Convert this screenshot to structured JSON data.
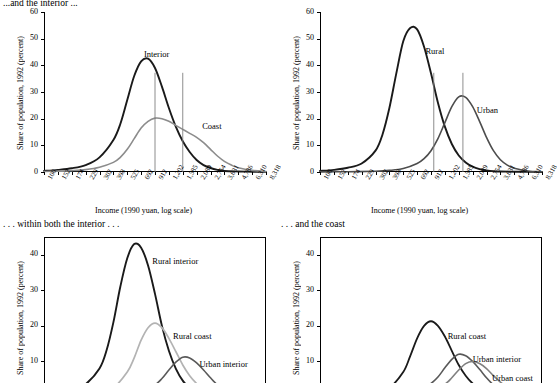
{
  "captions": {
    "top_left_partial": "...and the interior ...",
    "bottom_left": ". . . within both the interior . . .",
    "bottom_right": ". . . and the coast"
  },
  "axis": {
    "ylabel": "Share of population, 1992 (percent)",
    "xlabel": "Income (1990 yuan, log scale)",
    "yticks": [
      "0",
      "10",
      "20",
      "30",
      "40",
      "50",
      "60"
    ],
    "yticks_bottom": [
      "0",
      "10",
      "20",
      "30",
      "40"
    ],
    "xticks": [
      "100",
      "152",
      "174",
      "229",
      "302",
      "398",
      "525",
      "692",
      "912",
      "1,202",
      "1,585",
      "2,089",
      "2,754",
      "3,631",
      "4,786",
      "6,310",
      "8,318"
    ]
  },
  "chart_data": [
    {
      "id": "top-left",
      "type": "line",
      "title": "",
      "xlabel": "Income (1990 yuan, log scale)",
      "ylabel": "Share of population, 1992 (percent)",
      "xlim": [
        100,
        8318
      ],
      "ylim": [
        0,
        60
      ],
      "grid": false,
      "legend": "inline-annotations",
      "xtick_labels": [
        "100",
        "152",
        "174",
        "229",
        "302",
        "398",
        "525",
        "692",
        "912",
        "1,202",
        "1,585",
        "2,089",
        "2,754",
        "3,631",
        "4,786",
        "6,310",
        "8,318"
      ],
      "ytick_labels": [
        "0",
        "10",
        "20",
        "30",
        "40",
        "50",
        "60"
      ],
      "annotations": [
        {
          "text": "Interior",
          "x_index": 7.2,
          "y": 44
        },
        {
          "text": "Coast",
          "x_index": 11.4,
          "y": 17
        }
      ],
      "vertical_reference_lines": [
        {
          "x_index": 8.0
        },
        {
          "x_index": 10.0
        }
      ],
      "series": [
        {
          "name": "Interior",
          "color": "#1a1a1a",
          "width": 1.9,
          "x_index": [
            0,
            1,
            2,
            3,
            4,
            5,
            5.5,
            6,
            6.5,
            7,
            7.5,
            8,
            8.5,
            9,
            9.5,
            10,
            10.5,
            11,
            11.5,
            12,
            12.5,
            13,
            14,
            15,
            16
          ],
          "values": [
            0.4,
            0.8,
            1.4,
            2.6,
            5.5,
            12,
            18,
            27,
            36,
            41.5,
            42.5,
            39,
            32,
            24,
            17,
            11.5,
            7.5,
            4.5,
            2.6,
            1.5,
            0.8,
            0.4,
            0.2,
            0.1,
            0.05
          ]
        },
        {
          "name": "Coast",
          "color": "#8c8c8c",
          "width": 1.6,
          "x_index": [
            0,
            1,
            2,
            3,
            4,
            5,
            5.5,
            6,
            6.5,
            7,
            7.5,
            8,
            8.5,
            9,
            9.5,
            10,
            10.5,
            11,
            11.5,
            12,
            12.5,
            13,
            13.5,
            14,
            15,
            16
          ],
          "values": [
            0.2,
            0.3,
            0.5,
            0.9,
            1.8,
            3.6,
            5.5,
            8.5,
            12.5,
            16.5,
            19,
            20.2,
            20,
            19,
            17.5,
            16,
            14.5,
            13,
            11,
            8.5,
            6,
            4,
            2.6,
            1.6,
            0.6,
            0.2
          ]
        }
      ]
    },
    {
      "id": "top-right",
      "type": "line",
      "title": "",
      "xlabel": "Income (1990 yuan, log scale)",
      "ylabel": "Share of population, 1992 (percent)",
      "xlim": [
        100,
        8318
      ],
      "ylim": [
        0,
        60
      ],
      "grid": false,
      "xtick_labels": [
        "100",
        "152",
        "174",
        "229",
        "302",
        "398",
        "525",
        "692",
        "912",
        "1,202",
        "1,585",
        "2,089",
        "2,754",
        "3,631",
        "4,786",
        "6,310",
        "8,318"
      ],
      "ytick_labels": [
        "0",
        "10",
        "20",
        "30",
        "40",
        "50",
        "60"
      ],
      "annotations": [
        {
          "text": "Rural",
          "x_index": 7.6,
          "y": 45
        },
        {
          "text": "Urban",
          "x_index": 11.3,
          "y": 23
        }
      ],
      "vertical_reference_lines": [
        {
          "x_index": 8.2
        },
        {
          "x_index": 10.3
        }
      ],
      "series": [
        {
          "name": "Rural",
          "color": "#1a1a1a",
          "width": 1.9,
          "x_index": [
            0,
            1,
            2,
            3,
            4,
            4.5,
            5,
            5.5,
            6,
            6.5,
            7,
            7.5,
            8,
            8.5,
            9,
            9.5,
            10,
            10.5,
            11,
            11.5,
            12,
            12.5,
            13,
            14,
            15,
            16
          ],
          "values": [
            0.4,
            0.8,
            1.6,
            3.2,
            8,
            14,
            24,
            37,
            49,
            54,
            53.5,
            47,
            37,
            26,
            17,
            10.5,
            6.2,
            3.6,
            2,
            1.1,
            0.6,
            0.3,
            0.2,
            0.1,
            0.05,
            0.02
          ]
        },
        {
          "name": "Urban",
          "color": "#4d4d4d",
          "width": 1.6,
          "x_index": [
            0,
            2,
            4,
            5,
            6,
            7,
            7.5,
            8,
            8.5,
            9,
            9.5,
            10,
            10.5,
            11,
            11.5,
            12,
            12.5,
            13,
            13.5,
            14,
            15,
            16
          ],
          "values": [
            0.05,
            0.1,
            0.3,
            0.6,
            1.3,
            3.2,
            5,
            8,
            12.5,
            18.5,
            24.5,
            28.2,
            28,
            24.5,
            19,
            13,
            8,
            4.6,
            2.6,
            1.4,
            0.4,
            0.1
          ]
        }
      ]
    },
    {
      "id": "bottom-left",
      "type": "line",
      "title": ". . . within both the interior . . .",
      "ylabel": "Share of population, 1992 (percent)",
      "xlim": [
        100,
        8318
      ],
      "ylim": [
        0,
        45
      ],
      "grid": false,
      "ytick_labels": [
        "0",
        "10",
        "20",
        "30",
        "40"
      ],
      "annotations": [
        {
          "text": "Rural interior",
          "x_index": 7.8,
          "y": 38
        },
        {
          "text": "Rural coast",
          "x_index": 9.3,
          "y": 17
        },
        {
          "text": "Urban interior",
          "x_index": 11.2,
          "y": 9
        }
      ],
      "series": [
        {
          "name": "Rural interior",
          "color": "#1a1a1a",
          "width": 1.9,
          "x_index": [
            0,
            1,
            2,
            3,
            4,
            4.5,
            5,
            5.5,
            6,
            6.5,
            7,
            7.5,
            8,
            8.5,
            9,
            9.5,
            10,
            10.5,
            11,
            11.5,
            12,
            12.5,
            13,
            14,
            15,
            16
          ],
          "values": [
            0.4,
            0.9,
            1.8,
            3.6,
            8,
            13,
            21,
            31,
            39,
            43,
            42,
            37,
            29,
            20,
            13,
            8,
            4.6,
            2.6,
            1.4,
            0.8,
            0.4,
            0.2,
            0.1,
            0.05,
            0.02,
            0.01
          ]
        },
        {
          "name": "Rural coast",
          "color": "#b3b3b3",
          "width": 1.7,
          "x_index": [
            0,
            2,
            4,
            5,
            6,
            6.5,
            7,
            7.5,
            8,
            8.5,
            9,
            9.5,
            10,
            10.5,
            11,
            11.5,
            12,
            12.5,
            13,
            14,
            15,
            16
          ],
          "values": [
            0.1,
            0.3,
            1.2,
            2.6,
            7,
            11,
            16,
            19.5,
            20.8,
            19.5,
            16.5,
            12.8,
            9,
            6,
            3.8,
            2.2,
            1.2,
            0.6,
            0.3,
            0.1,
            0.05,
            0.02
          ]
        },
        {
          "name": "Urban interior",
          "color": "#595959",
          "width": 1.6,
          "x_index": [
            0,
            4,
            6,
            7,
            8,
            8.5,
            9,
            9.5,
            10,
            10.5,
            11,
            11.5,
            12,
            12.5,
            13,
            13.5,
            14,
            15,
            16
          ],
          "values": [
            0.02,
            0.1,
            0.4,
            1.2,
            3.4,
            5.2,
            7.6,
            9.8,
            11.2,
            11,
            9.6,
            7.6,
            5.4,
            3.4,
            2,
            1.1,
            0.6,
            0.15,
            0.05
          ]
        }
      ]
    },
    {
      "id": "bottom-right",
      "type": "line",
      "title": ". . . and the coast",
      "ylabel": "Share of population, 1992 (percent)",
      "xlim": [
        100,
        8318
      ],
      "ylim": [
        0,
        45
      ],
      "grid": false,
      "ytick_labels": [
        "0",
        "10",
        "20",
        "30",
        "40"
      ],
      "annotations": [
        {
          "text": "Rural coast",
          "x_index": 9.2,
          "y": 17
        },
        {
          "text": "Urban interior",
          "x_index": 11.0,
          "y": 10.5
        },
        {
          "text": "Urban coast",
          "x_index": 12.4,
          "y": 5
        }
      ],
      "series": [
        {
          "name": "Rural coast",
          "color": "#1a1a1a",
          "width": 1.8,
          "x_index": [
            0,
            2,
            4,
            5,
            6,
            6.5,
            7,
            7.5,
            8,
            8.5,
            9,
            9.5,
            10,
            10.5,
            11,
            11.5,
            12,
            12.5,
            13,
            14,
            15,
            16
          ],
          "values": [
            0.1,
            0.3,
            1.2,
            2.6,
            7,
            11.5,
            16.5,
            20,
            21.3,
            20,
            17,
            13,
            9,
            6,
            3.8,
            2.2,
            1.2,
            0.6,
            0.3,
            0.1,
            0.05,
            0.02
          ]
        },
        {
          "name": "Urban interior",
          "color": "#595959",
          "width": 1.6,
          "x_index": [
            0,
            4,
            6,
            7,
            8,
            8.5,
            9,
            9.5,
            10,
            10.5,
            11,
            11.5,
            12,
            12.5,
            13,
            13.5,
            14,
            15,
            16
          ],
          "values": [
            0.02,
            0.1,
            0.5,
            1.4,
            3.8,
            5.6,
            8.2,
            10.6,
            12,
            11.6,
            10,
            7.8,
            5.4,
            3.4,
            2,
            1.1,
            0.6,
            0.15,
            0.05
          ]
        },
        {
          "name": "Urban coast",
          "color": "#808080",
          "width": 1.6,
          "x_index": [
            0,
            5,
            7,
            8,
            9,
            9.5,
            10,
            10.5,
            11,
            11.5,
            12,
            12.5,
            13,
            13.5,
            14,
            15,
            16
          ],
          "values": [
            0.02,
            0.1,
            0.5,
            1.4,
            3.6,
            5.4,
            7.6,
            9.4,
            10,
            9.4,
            8,
            6,
            4.2,
            2.8,
            1.7,
            0.6,
            0.2
          ]
        }
      ]
    }
  ]
}
